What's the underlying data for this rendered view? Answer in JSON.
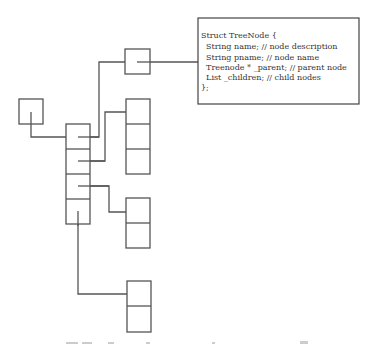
{
  "diagram": {
    "struct_box": {
      "lines": [
        "Struct TreeNode {",
        "  String name; // node description",
        "  String pname; // node name",
        "  Treenode * _parent; // parent node",
        "  List _children; // child nodes",
        "};"
      ]
    },
    "nodes": {
      "root": {
        "cells": 1
      },
      "main_column": {
        "cells": 4
      },
      "top_child": {
        "cells": 1
      },
      "child_group_1": {
        "cells": 3
      },
      "child_group_2": {
        "cells": 2
      },
      "child_group_3": {
        "cells": 2
      }
    },
    "colors": {
      "stroke": "#555555",
      "background": "#ffffff",
      "text": "#333333"
    }
  }
}
